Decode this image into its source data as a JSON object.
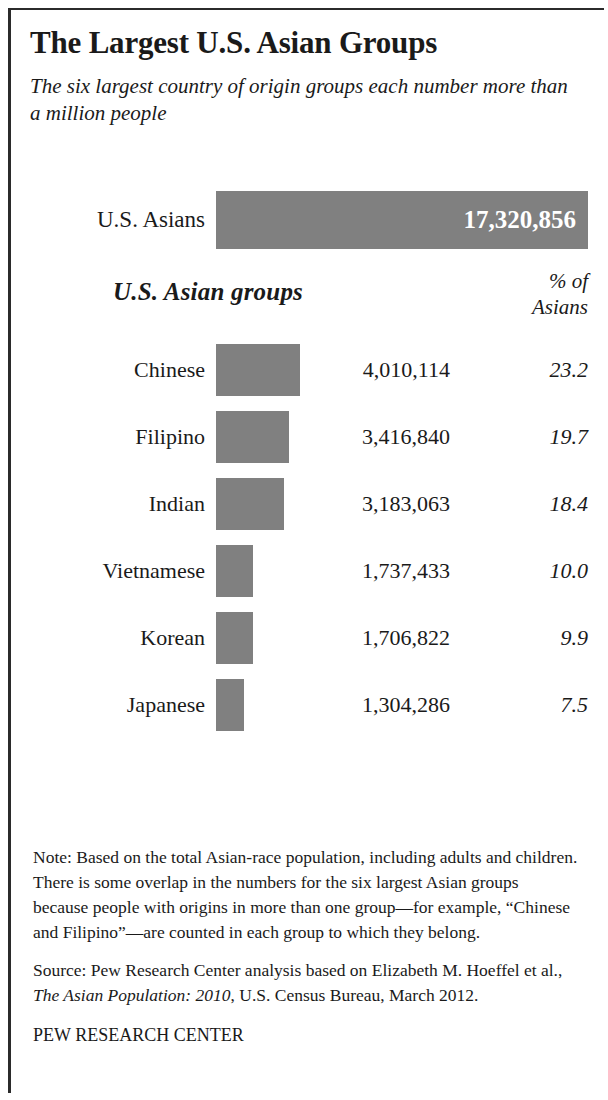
{
  "header": {
    "title": "The Largest U.S. Asian Groups",
    "subtitle": "The six largest country of origin groups each number more than a million people"
  },
  "total": {
    "label": "U.S. Asians",
    "value": "17,320,856"
  },
  "columns": {
    "groups_heading": "U.S. Asian groups",
    "pct_heading_line1": "% of",
    "pct_heading_line2": "Asians"
  },
  "footer": {
    "note": "Note: Based on the total Asian-race population, including adults and children. There is some overlap in the numbers for the six largest Asian groups because people with origins in more than one group—for example, “Chinese and Filipino”—are counted in each group to which they belong.",
    "source_prefix": "Source: Pew Research Center analysis based on Elizabeth M. Hoeffel et al., ",
    "source_italic": "The Asian Population: 2010",
    "source_suffix": ", U.S. Census Bureau, March 2012.",
    "organization": "PEW RESEARCH CENTER"
  },
  "colors": {
    "bar_fill": "#808080",
    "frame": "#2b2b2b",
    "text": "#1a1a1a",
    "total_value_text": "#ffffff",
    "background": "#ffffff"
  },
  "chart_data": {
    "type": "bar",
    "title": "The Largest U.S. Asian Groups",
    "subtitle": "The six largest country of origin groups each number more than a million people",
    "orientation": "horizontal",
    "xlabel": "",
    "ylabel": "",
    "grid": false,
    "legend": null,
    "value_axis_max": 17320856,
    "bar_pixel_scale": "372px = 17,320,856",
    "total": {
      "category": "U.S. Asians",
      "value": 17320856,
      "value_label": "17,320,856",
      "bar_width_px": 372
    },
    "categories": [
      "Chinese",
      "Filipino",
      "Indian",
      "Vietnamese",
      "Korean",
      "Japanese"
    ],
    "values": [
      4010114,
      3416840,
      3183063,
      1737433,
      1706822,
      1304286
    ],
    "value_labels": [
      "4,010,114",
      "3,416,840",
      "3,183,063",
      "1,737,433",
      "1,706,822",
      "1,304,286"
    ],
    "percent_of_asians": [
      23.2,
      19.7,
      18.4,
      10.0,
      9.9,
      7.5
    ],
    "percent_labels": [
      "23.2",
      "19.7",
      "18.4",
      "10.0",
      "9.9",
      "7.5"
    ],
    "bar_widths_px": [
      84,
      73,
      68,
      37,
      37,
      28
    ],
    "bar_heights_px": [
      52,
      52,
      52,
      52,
      52,
      52
    ]
  },
  "rows": [
    {
      "label": "Chinese",
      "value": "4,010,114",
      "pct": "23.2",
      "bar_px": 84
    },
    {
      "label": "Filipino",
      "value": "3,416,840",
      "pct": "19.7",
      "bar_px": 73
    },
    {
      "label": "Indian",
      "value": "3,183,063",
      "pct": "18.4",
      "bar_px": 68
    },
    {
      "label": "Vietnamese",
      "value": "1,737,433",
      "pct": "10.0",
      "bar_px": 37
    },
    {
      "label": "Korean",
      "value": "1,706,822",
      "pct": "9.9",
      "bar_px": 37
    },
    {
      "label": "Japanese",
      "value": "1,304,286",
      "pct": "7.5",
      "bar_px": 28
    }
  ]
}
